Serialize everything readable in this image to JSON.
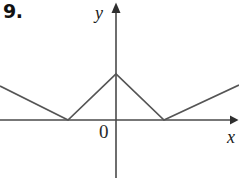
{
  "figure": {
    "problem_number": "9.",
    "width": 239,
    "height": 178,
    "background_color": "#ffffff",
    "stroke_color": "#555555",
    "axis_color": "#4a4a4a",
    "text_color": "#1a1a1a"
  },
  "labels": {
    "y_axis": "y",
    "x_axis": "x",
    "origin": "0"
  },
  "chart_data": {
    "type": "line",
    "title": "9.",
    "xlabel": "x",
    "ylabel": "y",
    "grid": false,
    "legend": null,
    "axes": {
      "origin_px": [
        116,
        120
      ],
      "x_axis_y_px": 120,
      "y_axis_x_px": 116,
      "x_arrow_tip_px": [
        238,
        120
      ],
      "y_arrow_tip_px": [
        116,
        3
      ],
      "y_axis_bottom_px": 178,
      "x_axis_left_px": 0
    },
    "vertices_px": [
      [
        0,
        86
      ],
      [
        68,
        120
      ],
      [
        116,
        74
      ],
      [
        164,
        120
      ],
      [
        239,
        85
      ]
    ],
    "vertices_data": [
      {
        "x": -2.4,
        "y": 1.5,
        "kind": "edge"
      },
      {
        "x": -1.0,
        "y": 0.0,
        "kind": "minimum"
      },
      {
        "x": 0.0,
        "y": 2.0,
        "kind": "maximum"
      },
      {
        "x": 1.0,
        "y": 0.0,
        "kind": "minimum"
      },
      {
        "x": 2.55,
        "y": 1.55,
        "kind": "edge"
      }
    ],
    "x": [
      -2.4,
      -1.0,
      0.0,
      1.0,
      2.55
    ],
    "values": [
      1.5,
      0.0,
      2.0,
      0.0,
      1.55
    ],
    "xlim": [
      -2.4,
      2.55
    ],
    "ylim": [
      0,
      2.0
    ]
  }
}
